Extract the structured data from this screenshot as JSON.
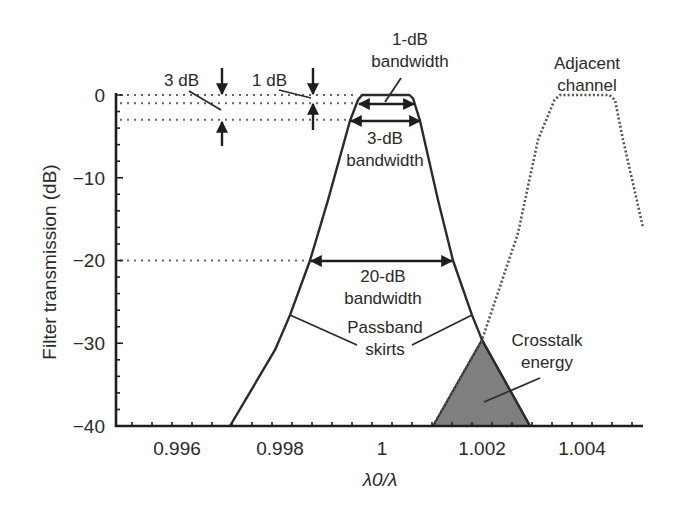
{
  "chart_data": {
    "type": "line",
    "title": "",
    "xlabel": "λ0/λ",
    "ylabel": "Filter transmission (dB)",
    "xlim": [
      0.9948,
      1.0053
    ],
    "ylim": [
      -40,
      0
    ],
    "x_ticks": [
      0.996,
      0.998,
      1,
      1.002,
      1.004
    ],
    "x_tick_labels": [
      "0.996",
      "0.998",
      "1",
      "1.002",
      "1.004"
    ],
    "y_ticks": [
      0,
      -10,
      -20,
      -30,
      -40
    ],
    "y_tick_labels": [
      "0",
      "−10",
      "−20",
      "−30",
      "−40"
    ],
    "grid": false,
    "series": [
      {
        "name": "Filter passband",
        "style": "solid",
        "x": [
          0.99696,
          0.99786,
          0.99816,
          0.99856,
          0.99892,
          0.99936,
          0.99952,
          0.9996,
          1.00055,
          1.00062,
          1.00076,
          1.00112,
          1.00142,
          1.0018,
          1.002,
          1.00296
        ],
        "y": [
          -40,
          -30.8,
          -26.6,
          -20,
          -12.7,
          -3.1,
          -0.6,
          0,
          0,
          -0.4,
          -3.1,
          -12.7,
          -20,
          -26.6,
          -29.6,
          -40
        ]
      },
      {
        "name": "Adjacent channel",
        "style": "dotted",
        "x": [
          1.00102,
          1.002,
          1.00272,
          1.00312,
          1.00345,
          1.00356,
          1.00455,
          1.00466,
          1.00482,
          1.00522
        ],
        "y": [
          -40,
          -29.6,
          -16.7,
          -5.4,
          -0.6,
          0,
          0,
          -0.6,
          -5.4,
          -16
        ]
      }
    ],
    "shaded_regions": [
      {
        "name": "Crosstalk energy",
        "x": [
          1.00102,
          1.002,
          1.00296
        ],
        "y": [
          -40,
          -29.6,
          -40
        ],
        "color": "#7f7f7f"
      }
    ],
    "reference_lines": [
      {
        "y": 0,
        "x_end": 0.9995
      },
      {
        "y": -1,
        "x_end": 0.99952
      },
      {
        "y": -3,
        "x_end": 0.99936
      },
      {
        "y": -20,
        "x_end": 0.99856
      }
    ],
    "bandwidth_markers": [
      {
        "label": "1-dB bandwidth",
        "y": -1,
        "x_start": 0.99952,
        "x_end": 1.00066
      },
      {
        "label": "3-dB bandwidth",
        "y": -3,
        "x_start": 0.99936,
        "x_end": 1.00076
      },
      {
        "label": "20-dB bandwidth",
        "y": -20,
        "x_start": 0.99856,
        "x_end": 1.00142
      }
    ],
    "annotations": {
      "three_db": "3 dB",
      "one_db": "1 dB",
      "one_db_bw_line1": "1-dB",
      "one_db_bw_line2": "bandwidth",
      "three_db_bw_line1": "3-dB",
      "three_db_bw_line2": "bandwidth",
      "twenty_db_bw_line1": "20-dB",
      "twenty_db_bw_line2": "bandwidth",
      "passband_line1": "Passband",
      "passband_line2": "skirts",
      "crosstalk_line1": "Crosstalk",
      "crosstalk_line2": "energy",
      "adjacent_line1": "Adjacent",
      "adjacent_line2": "channel"
    }
  }
}
